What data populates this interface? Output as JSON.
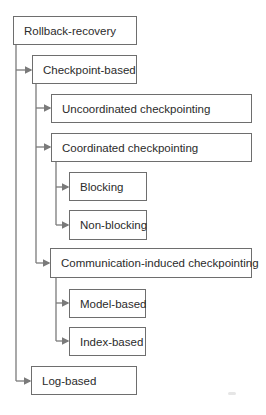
{
  "diagram": {
    "type": "hierarchy-tree",
    "root": {
      "label": "Rollback-recovery",
      "children": [
        {
          "label": "Checkpoint-based",
          "children": [
            {
              "label": "Uncoordinated checkpointing"
            },
            {
              "label": "Coordinated checkpointing",
              "children": [
                {
                  "label": "Blocking"
                },
                {
                  "label": "Non-blocking"
                }
              ]
            },
            {
              "label": "Communication-induced checkpointing",
              "children": [
                {
                  "label": "Model-based"
                },
                {
                  "label": "Index-based"
                }
              ]
            }
          ]
        },
        {
          "label": "Log-based"
        }
      ]
    },
    "colors": {
      "border": "#6e6e6e",
      "line": "#7a7a7a",
      "text": "#2b2b2b",
      "background": "#ffffff"
    }
  }
}
